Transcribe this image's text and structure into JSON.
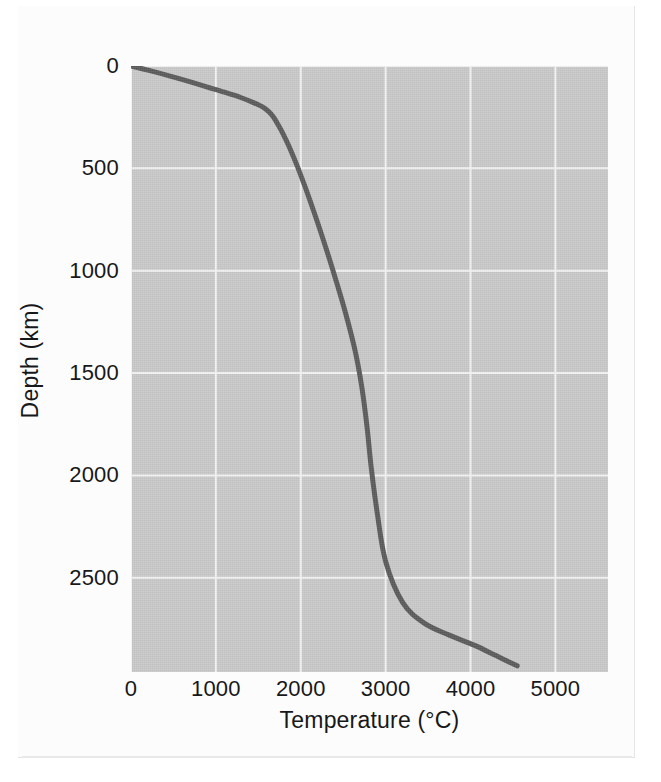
{
  "figure": {
    "kind": "scientific-line-chart",
    "caption_text": "",
    "background_color": "#ffffff",
    "sheet_color": "#fcfcfc"
  },
  "chart_data": {
    "type": "line",
    "title": "",
    "subtitle": "",
    "xlabel": "Temperature (°C)",
    "ylabel": "Depth (km)",
    "xlim": [
      0,
      5620
    ],
    "ylim": [
      0,
      2960
    ],
    "y_inverted": true,
    "grid": true,
    "legend": null,
    "legend_position": "none",
    "plot_background_color": "#c9c9c9",
    "gridline_color": "#f3f3f3",
    "line_color": "#5a5a5a",
    "line_width_px": 5,
    "x_ticks": [
      {
        "value": 0,
        "label": "0"
      },
      {
        "value": 1000,
        "label": "1000"
      },
      {
        "value": 2000,
        "label": "2000"
      },
      {
        "value": 3000,
        "label": "3000"
      },
      {
        "value": 4000,
        "label": "4000"
      },
      {
        "value": 5000,
        "label": "5000"
      }
    ],
    "y_ticks": [
      {
        "value": 0,
        "label": "0"
      },
      {
        "value": 500,
        "label": "500"
      },
      {
        "value": 1000,
        "label": "1000"
      },
      {
        "value": 1500,
        "label": "1500"
      },
      {
        "value": 2000,
        "label": "2000"
      },
      {
        "value": 2500,
        "label": "2500"
      }
    ],
    "series": [
      {
        "name": "Geotherm",
        "x": [
          0,
          200,
          450,
          700,
          900,
          1100,
          1300,
          1450,
          1550,
          1620,
          1680,
          1730,
          1790,
          1870,
          1960,
          2060,
          2170,
          2290,
          2410,
          2530,
          2640,
          2720,
          2780,
          2830,
          2900,
          3000,
          3200,
          3450,
          3750,
          4050,
          4300,
          4550
        ],
        "y": [
          0,
          20,
          48,
          78,
          103,
          128,
          155,
          180,
          200,
          222,
          250,
          285,
          330,
          400,
          490,
          600,
          730,
          880,
          1040,
          1210,
          1390,
          1570,
          1760,
          1960,
          2180,
          2420,
          2620,
          2720,
          2780,
          2830,
          2880,
          2930
        ]
      }
    ]
  },
  "axes": {
    "x_title": "Temperature (°C)",
    "y_title": "Depth (km)"
  }
}
